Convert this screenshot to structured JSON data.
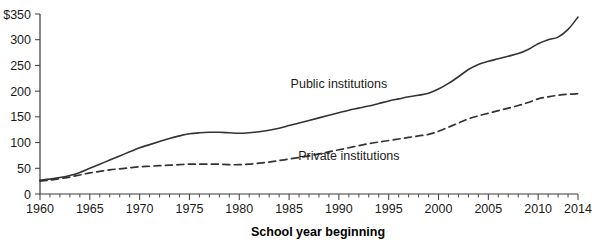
{
  "chart_data": {
    "type": "line",
    "title": "",
    "subtitle": "",
    "xlabel": "School year beginning",
    "ylabel": "",
    "xlim": [
      1960,
      2014
    ],
    "ylim": [
      0,
      350
    ],
    "grid": false,
    "legend_position": "inline-annotation",
    "y_ticks": [
      0,
      50,
      100,
      150,
      200,
      250,
      300,
      350
    ],
    "y_tick_labels": [
      "0",
      "50",
      "100",
      "150",
      "200",
      "250",
      "300",
      "$350"
    ],
    "x_ticks": [
      1960,
      1965,
      1970,
      1975,
      1980,
      1985,
      1990,
      1995,
      2000,
      2005,
      2010,
      2014
    ],
    "x_tick_labels": [
      "1960",
      "1965",
      "1970",
      "1975",
      "1980",
      "1985",
      "1990",
      "1995",
      "2000",
      "2005",
      "2010",
      "2014"
    ],
    "x_minor_tick_step": 1,
    "units": "dollars (index, constant)",
    "series": [
      {
        "name": "Public institutions",
        "style": "solid",
        "color": "#333333",
        "label_x": 1990,
        "label_y": 215,
        "x": [
          1960,
          1961,
          1962,
          1963,
          1964,
          1965,
          1966,
          1967,
          1968,
          1969,
          1970,
          1971,
          1972,
          1973,
          1974,
          1975,
          1976,
          1977,
          1978,
          1979,
          1980,
          1981,
          1982,
          1983,
          1984,
          1985,
          1986,
          1987,
          1988,
          1989,
          1990,
          1991,
          1992,
          1993,
          1994,
          1995,
          1996,
          1997,
          1998,
          1999,
          2000,
          2001,
          2002,
          2003,
          2004,
          2005,
          2006,
          2007,
          2008,
          2009,
          2010,
          2011,
          2012,
          2013,
          2014
        ],
        "values": [
          27,
          29,
          32,
          36,
          42,
          50,
          58,
          66,
          74,
          82,
          90,
          96,
          102,
          108,
          113,
          117,
          119,
          120,
          120,
          119,
          118,
          119,
          121,
          124,
          128,
          133,
          138,
          143,
          148,
          153,
          158,
          163,
          167,
          171,
          176,
          181,
          185,
          189,
          192,
          196,
          204,
          215,
          228,
          242,
          252,
          258,
          263,
          268,
          273,
          281,
          292,
          300,
          305,
          320,
          344
        ]
      },
      {
        "name": "Private institutions",
        "style": "dashed",
        "color": "#333333",
        "label_x": 1991,
        "label_y": 75,
        "x": [
          1960,
          1961,
          1962,
          1963,
          1964,
          1965,
          1966,
          1967,
          1968,
          1969,
          1970,
          1971,
          1972,
          1973,
          1974,
          1975,
          1976,
          1977,
          1978,
          1979,
          1980,
          1981,
          1982,
          1983,
          1984,
          1985,
          1986,
          1987,
          1988,
          1989,
          1990,
          1991,
          1992,
          1993,
          1994,
          1995,
          1996,
          1997,
          1998,
          1999,
          2000,
          2001,
          2002,
          2003,
          2004,
          2005,
          2006,
          2007,
          2008,
          2009,
          2010,
          2011,
          2012,
          2013,
          2014
        ],
        "values": [
          25,
          27,
          30,
          33,
          37,
          41,
          44,
          47,
          49,
          51,
          53,
          54,
          55,
          56,
          57,
          58,
          58,
          58,
          58,
          57,
          57,
          58,
          60,
          62,
          65,
          68,
          71,
          74,
          78,
          82,
          86,
          90,
          94,
          98,
          101,
          104,
          107,
          110,
          113,
          116,
          122,
          130,
          138,
          146,
          152,
          157,
          162,
          167,
          172,
          178,
          185,
          189,
          192,
          194,
          195
        ]
      }
    ]
  },
  "axis": {
    "x_title": "School year beginning"
  },
  "annotations": [
    {
      "text": "Public institutions"
    },
    {
      "text": "Private institutions"
    }
  ]
}
